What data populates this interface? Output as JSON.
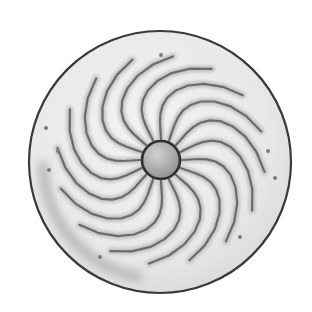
{
  "image": {
    "subject": "Pencil drawing of a round shield with swirling radial ridges around a central boss",
    "style": "graphite sketch",
    "colors": {
      "background": "#ffffff",
      "shield_fill": "#ebebeb",
      "outline": "#3a3a3a",
      "ridge": "#5a5a5a",
      "boss_fill": "#b4b4b4",
      "boss_outline": "#2e2e2e",
      "dot": "#7a7a7a"
    },
    "shield": {
      "cx": 160,
      "cy": 162,
      "r": 131
    },
    "boss": {
      "cx": 161,
      "cy": 160,
      "r": 19
    },
    "ridge_count": 16,
    "dots": [
      [
        161,
        55
      ],
      [
        46,
        128
      ],
      [
        58,
        151
      ],
      [
        49,
        170
      ],
      [
        268,
        151
      ],
      [
        275,
        178
      ],
      [
        240,
        237
      ],
      [
        100,
        257
      ]
    ]
  }
}
